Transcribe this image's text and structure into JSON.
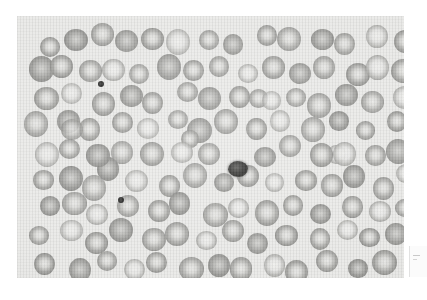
{
  "figure": {
    "domain": "Natural-Image",
    "kind": "light-microscopy-photomicrograph",
    "modality": "brightfield microscopy, grayscale print reproduction",
    "caption": "",
    "canvas": {
      "width": 426,
      "height": 300,
      "background_color": "#ffffff"
    },
    "plate": {
      "x": 17,
      "y": 16,
      "width": 387,
      "height": 262,
      "background_color": "#e9e9e7",
      "border": "none"
    },
    "colors": {
      "background": "#ffffff",
      "field": "#e9e9e7",
      "cell_rim": "#96968f",
      "cell_centre": "#e3e3e1",
      "dark_object": "#242422",
      "artifact_box": "#fbfbfb"
    },
    "texture": {
      "scan_lines": "vertical",
      "grain": "film-grain halftone"
    }
  },
  "objects": {
    "erythrocyte_label": "red blood cell",
    "platelet_label": "platelet",
    "nucleated_cell_label": "nucleated cell",
    "counts": {
      "erythrocytes": 112,
      "platelets": 3,
      "nucleated_cells": 1
    },
    "erythrocytes": [
      {
        "cx": 29,
        "cy": 30,
        "r": 11,
        "tone": "normal"
      },
      {
        "cx": 56,
        "cy": 24,
        "r": 11,
        "tone": "dense"
      },
      {
        "cx": 82,
        "cy": 22,
        "r": 11,
        "tone": "normal"
      },
      {
        "cx": 110,
        "cy": 26,
        "r": 11,
        "tone": "dense"
      },
      {
        "cx": 138,
        "cy": 22,
        "r": 11,
        "tone": "normal"
      },
      {
        "cx": 165,
        "cy": 27,
        "r": 11,
        "tone": "pale"
      },
      {
        "cx": 192,
        "cy": 22,
        "r": 11,
        "tone": "normal"
      },
      {
        "cx": 219,
        "cy": 27,
        "r": 11,
        "tone": "dense"
      },
      {
        "cx": 246,
        "cy": 22,
        "r": 11,
        "tone": "normal"
      },
      {
        "cx": 275,
        "cy": 25,
        "r": 11,
        "tone": "normal"
      },
      {
        "cx": 302,
        "cy": 21,
        "r": 11,
        "tone": "dense"
      },
      {
        "cx": 330,
        "cy": 26,
        "r": 11,
        "tone": "normal"
      },
      {
        "cx": 358,
        "cy": 22,
        "r": 11,
        "tone": "pale"
      },
      {
        "cx": 384,
        "cy": 28,
        "r": 11,
        "tone": "normal"
      },
      {
        "cx": 24,
        "cy": 55,
        "r": 11,
        "tone": "dense"
      },
      {
        "cx": 49,
        "cy": 48,
        "r": 11,
        "tone": "normal"
      },
      {
        "cx": 72,
        "cy": 58,
        "r": 11,
        "tone": "normal"
      },
      {
        "cx": 100,
        "cy": 52,
        "r": 11,
        "tone": "pale"
      },
      {
        "cx": 126,
        "cy": 58,
        "r": 11,
        "tone": "normal"
      },
      {
        "cx": 152,
        "cy": 50,
        "r": 11,
        "tone": "dense"
      },
      {
        "cx": 178,
        "cy": 57,
        "r": 11,
        "tone": "normal"
      },
      {
        "cx": 205,
        "cy": 50,
        "r": 11,
        "tone": "normal"
      },
      {
        "cx": 232,
        "cy": 57,
        "r": 11,
        "tone": "pale"
      },
      {
        "cx": 258,
        "cy": 50,
        "r": 11,
        "tone": "normal"
      },
      {
        "cx": 284,
        "cy": 57,
        "r": 11,
        "tone": "dense"
      },
      {
        "cx": 311,
        "cy": 50,
        "r": 11,
        "tone": "normal"
      },
      {
        "cx": 338,
        "cy": 57,
        "r": 11,
        "tone": "normal"
      },
      {
        "cx": 364,
        "cy": 51,
        "r": 11,
        "tone": "pale"
      },
      {
        "cx": 389,
        "cy": 57,
        "r": 11,
        "tone": "normal"
      },
      {
        "cx": 30,
        "cy": 82,
        "r": 11,
        "tone": "normal"
      },
      {
        "cx": 58,
        "cy": 78,
        "r": 11,
        "tone": "pale"
      },
      {
        "cx": 86,
        "cy": 86,
        "r": 11,
        "tone": "normal"
      },
      {
        "cx": 112,
        "cy": 80,
        "r": 11,
        "tone": "dense"
      },
      {
        "cx": 140,
        "cy": 86,
        "r": 11,
        "tone": "normal"
      },
      {
        "cx": 168,
        "cy": 79,
        "r": 11,
        "tone": "normal"
      },
      {
        "cx": 196,
        "cy": 86,
        "r": 11,
        "tone": "dense"
      },
      {
        "cx": 222,
        "cy": 80,
        "r": 11,
        "tone": "normal"
      },
      {
        "cx": 250,
        "cy": 86,
        "r": 11,
        "tone": "pale"
      },
      {
        "cx": 277,
        "cy": 79,
        "r": 11,
        "tone": "normal"
      },
      {
        "cx": 304,
        "cy": 86,
        "r": 11,
        "tone": "normal"
      },
      {
        "cx": 331,
        "cy": 80,
        "r": 11,
        "tone": "dense"
      },
      {
        "cx": 359,
        "cy": 86,
        "r": 11,
        "tone": "normal"
      },
      {
        "cx": 385,
        "cy": 80,
        "r": 11,
        "tone": "pale"
      },
      {
        "cx": 22,
        "cy": 110,
        "r": 11,
        "tone": "normal"
      },
      {
        "cx": 48,
        "cy": 104,
        "r": 11,
        "tone": "dense"
      },
      {
        "cx": 75,
        "cy": 112,
        "r": 11,
        "tone": "normal"
      },
      {
        "cx": 102,
        "cy": 106,
        "r": 11,
        "tone": "normal"
      },
      {
        "cx": 130,
        "cy": 113,
        "r": 11,
        "tone": "pale"
      },
      {
        "cx": 157,
        "cy": 105,
        "r": 11,
        "tone": "normal"
      },
      {
        "cx": 185,
        "cy": 112,
        "r": 11,
        "tone": "dense"
      },
      {
        "cx": 212,
        "cy": 105,
        "r": 11,
        "tone": "normal"
      },
      {
        "cx": 240,
        "cy": 112,
        "r": 11,
        "tone": "normal"
      },
      {
        "cx": 266,
        "cy": 106,
        "r": 11,
        "tone": "pale"
      },
      {
        "cx": 294,
        "cy": 113,
        "r": 11,
        "tone": "normal"
      },
      {
        "cx": 321,
        "cy": 105,
        "r": 11,
        "tone": "dense"
      },
      {
        "cx": 349,
        "cy": 112,
        "r": 11,
        "tone": "normal"
      },
      {
        "cx": 377,
        "cy": 106,
        "r": 11,
        "tone": "normal"
      },
      {
        "cx": 28,
        "cy": 138,
        "r": 11,
        "tone": "pale"
      },
      {
        "cx": 55,
        "cy": 132,
        "r": 11,
        "tone": "normal"
      },
      {
        "cx": 82,
        "cy": 140,
        "r": 11,
        "tone": "dense"
      },
      {
        "cx": 108,
        "cy": 133,
        "r": 11,
        "tone": "normal"
      },
      {
        "cx": 136,
        "cy": 141,
        "r": 11,
        "tone": "normal"
      },
      {
        "cx": 163,
        "cy": 134,
        "r": 11,
        "tone": "pale"
      },
      {
        "cx": 190,
        "cy": 141,
        "r": 11,
        "tone": "normal"
      },
      {
        "cx": 246,
        "cy": 140,
        "r": 11,
        "tone": "dense"
      },
      {
        "cx": 273,
        "cy": 133,
        "r": 11,
        "tone": "normal"
      },
      {
        "cx": 300,
        "cy": 141,
        "r": 11,
        "tone": "normal"
      },
      {
        "cx": 328,
        "cy": 134,
        "r": 11,
        "tone": "pale"
      },
      {
        "cx": 356,
        "cy": 141,
        "r": 11,
        "tone": "normal"
      },
      {
        "cx": 383,
        "cy": 134,
        "r": 11,
        "tone": "dense"
      },
      {
        "cx": 24,
        "cy": 166,
        "r": 11,
        "tone": "normal"
      },
      {
        "cx": 51,
        "cy": 160,
        "r": 11,
        "tone": "dense"
      },
      {
        "cx": 78,
        "cy": 168,
        "r": 11,
        "tone": "normal"
      },
      {
        "cx": 122,
        "cy": 164,
        "r": 11,
        "tone": "pale"
      },
      {
        "cx": 150,
        "cy": 170,
        "r": 11,
        "tone": "normal"
      },
      {
        "cx": 177,
        "cy": 162,
        "r": 11,
        "tone": "normal"
      },
      {
        "cx": 204,
        "cy": 169,
        "r": 11,
        "tone": "dense"
      },
      {
        "cx": 231,
        "cy": 162,
        "r": 11,
        "tone": "normal"
      },
      {
        "cx": 259,
        "cy": 169,
        "r": 11,
        "tone": "pale"
      },
      {
        "cx": 286,
        "cy": 162,
        "r": 11,
        "tone": "normal"
      },
      {
        "cx": 313,
        "cy": 169,
        "r": 11,
        "tone": "normal"
      },
      {
        "cx": 341,
        "cy": 162,
        "r": 11,
        "tone": "dense"
      },
      {
        "cx": 369,
        "cy": 169,
        "r": 11,
        "tone": "normal"
      },
      {
        "cx": 392,
        "cy": 161,
        "r": 11,
        "tone": "pale"
      },
      {
        "cx": 30,
        "cy": 194,
        "r": 11,
        "tone": "dense"
      },
      {
        "cx": 57,
        "cy": 188,
        "r": 11,
        "tone": "normal"
      },
      {
        "cx": 84,
        "cy": 196,
        "r": 11,
        "tone": "pale"
      },
      {
        "cx": 112,
        "cy": 189,
        "r": 11,
        "tone": "normal"
      },
      {
        "cx": 139,
        "cy": 197,
        "r": 11,
        "tone": "normal"
      },
      {
        "cx": 167,
        "cy": 190,
        "r": 11,
        "tone": "dense"
      },
      {
        "cx": 194,
        "cy": 197,
        "r": 11,
        "tone": "normal"
      },
      {
        "cx": 222,
        "cy": 190,
        "r": 11,
        "tone": "pale"
      },
      {
        "cx": 249,
        "cy": 197,
        "r": 11,
        "tone": "normal"
      },
      {
        "cx": 277,
        "cy": 190,
        "r": 11,
        "tone": "normal"
      },
      {
        "cx": 304,
        "cy": 197,
        "r": 11,
        "tone": "dense"
      },
      {
        "cx": 332,
        "cy": 190,
        "r": 11,
        "tone": "normal"
      },
      {
        "cx": 360,
        "cy": 197,
        "r": 11,
        "tone": "pale"
      },
      {
        "cx": 387,
        "cy": 190,
        "r": 11,
        "tone": "normal"
      },
      {
        "cx": 25,
        "cy": 222,
        "r": 11,
        "tone": "normal"
      },
      {
        "cx": 52,
        "cy": 216,
        "r": 11,
        "tone": "pale"
      },
      {
        "cx": 80,
        "cy": 224,
        "r": 11,
        "tone": "normal"
      },
      {
        "cx": 107,
        "cy": 217,
        "r": 11,
        "tone": "dense"
      },
      {
        "cx": 135,
        "cy": 225,
        "r": 11,
        "tone": "normal"
      },
      {
        "cx": 162,
        "cy": 218,
        "r": 11,
        "tone": "normal"
      },
      {
        "cx": 190,
        "cy": 225,
        "r": 11,
        "tone": "pale"
      },
      {
        "cx": 217,
        "cy": 218,
        "r": 11,
        "tone": "normal"
      },
      {
        "cx": 245,
        "cy": 225,
        "r": 11,
        "tone": "dense"
      },
      {
        "cx": 272,
        "cy": 218,
        "r": 11,
        "tone": "normal"
      },
      {
        "cx": 300,
        "cy": 225,
        "r": 11,
        "tone": "normal"
      },
      {
        "cx": 327,
        "cy": 218,
        "r": 11,
        "tone": "pale"
      },
      {
        "cx": 355,
        "cy": 225,
        "r": 11,
        "tone": "normal"
      },
      {
        "cx": 382,
        "cy": 218,
        "r": 11,
        "tone": "dense"
      },
      {
        "cx": 31,
        "cy": 248,
        "r": 11,
        "tone": "normal"
      },
      {
        "cx": 59,
        "cy": 254,
        "r": 11,
        "tone": "dense"
      },
      {
        "cx": 87,
        "cy": 247,
        "r": 11,
        "tone": "normal"
      },
      {
        "cx": 115,
        "cy": 254,
        "r": 11,
        "tone": "pale"
      },
      {
        "cx": 143,
        "cy": 247,
        "r": 11,
        "tone": "normal"
      },
      {
        "cx": 171,
        "cy": 254,
        "r": 11,
        "tone": "normal"
      },
      {
        "cx": 199,
        "cy": 247,
        "r": 11,
        "tone": "dense"
      },
      {
        "cx": 227,
        "cy": 254,
        "r": 11,
        "tone": "normal"
      },
      {
        "cx": 255,
        "cy": 247,
        "r": 11,
        "tone": "pale"
      },
      {
        "cx": 283,
        "cy": 254,
        "r": 11,
        "tone": "normal"
      },
      {
        "cx": 311,
        "cy": 247,
        "r": 11,
        "tone": "normal"
      },
      {
        "cx": 339,
        "cy": 254,
        "r": 11,
        "tone": "dense"
      },
      {
        "cx": 367,
        "cy": 247,
        "r": 11,
        "tone": "normal"
      },
      {
        "cx": 58,
        "cy": 116,
        "r": 10,
        "tone": "normal"
      },
      {
        "cx": 95,
        "cy": 150,
        "r": 10,
        "tone": "dense"
      },
      {
        "cx": 240,
        "cy": 85,
        "r": 10,
        "tone": "normal"
      },
      {
        "cx": 318,
        "cy": 139,
        "r": 10,
        "tone": "pale"
      },
      {
        "cx": 170,
        "cy": 120,
        "r": 10,
        "tone": "normal"
      }
    ],
    "platelets": [
      {
        "cx": 84,
        "cy": 68,
        "r": 3
      },
      {
        "cx": 104,
        "cy": 184,
        "r": 3
      },
      {
        "cx": 394,
        "cy": 64,
        "r": 3
      }
    ],
    "nucleated_cells": [
      {
        "cx": 221,
        "cy": 153,
        "rx": 10,
        "ry": 8
      }
    ]
  },
  "artifact": {
    "label": "clipped caption box at right margin",
    "x": 409,
    "y": 246,
    "width": 17,
    "height": 31
  }
}
